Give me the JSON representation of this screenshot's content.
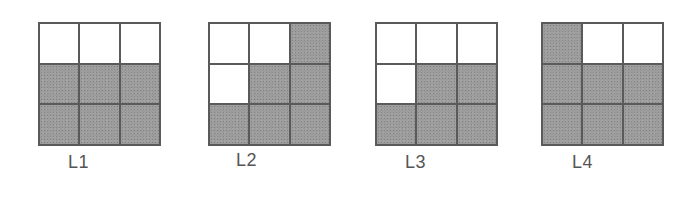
{
  "colors": {
    "shaded": "#9c9c9c",
    "empty": "#ffffff",
    "grid_line": "#5a5a5a",
    "label": "#555555"
  },
  "panels": [
    {
      "label": "L1",
      "cells": [
        [
          0,
          0,
          0
        ],
        [
          1,
          1,
          1
        ],
        [
          1,
          1,
          1
        ]
      ]
    },
    {
      "label": "L2",
      "cells": [
        [
          0,
          0,
          1
        ],
        [
          0,
          1,
          1
        ],
        [
          1,
          1,
          1
        ]
      ]
    },
    {
      "label": "L3",
      "cells": [
        [
          0,
          0,
          0
        ],
        [
          0,
          1,
          1
        ],
        [
          1,
          1,
          1
        ]
      ]
    },
    {
      "label": "L4",
      "cells": [
        [
          1,
          0,
          0
        ],
        [
          1,
          1,
          1
        ],
        [
          1,
          1,
          1
        ]
      ]
    }
  ]
}
